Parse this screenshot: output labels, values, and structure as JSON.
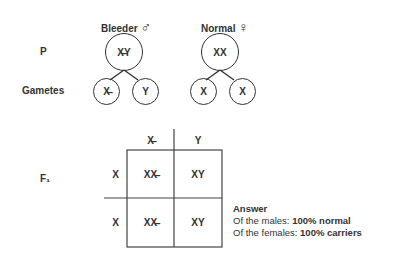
{
  "parents": {
    "row_label": "P",
    "male": {
      "label": "Bleeder",
      "symbol": "♂",
      "genotype": "X̶Y"
    },
    "female": {
      "label": "Normal",
      "symbol": "♀",
      "genotype": "XX"
    }
  },
  "gametes": {
    "row_label": "Gametes",
    "male": [
      "X̶",
      "Y"
    ],
    "female": [
      "X",
      "X"
    ]
  },
  "f1": {
    "row_label": "F₁",
    "col_headers": [
      "X̶",
      "Y"
    ],
    "row_headers": [
      "X",
      "X"
    ],
    "cells": [
      [
        "XX̶",
        "XY"
      ],
      [
        "XX̶",
        "XY"
      ]
    ]
  },
  "answer": {
    "title": "Answer",
    "line1_prefix": "Of the males: ",
    "line1_value": "100% normal",
    "line2_prefix": "Of the females: ",
    "line2_value": "100% carriers"
  }
}
